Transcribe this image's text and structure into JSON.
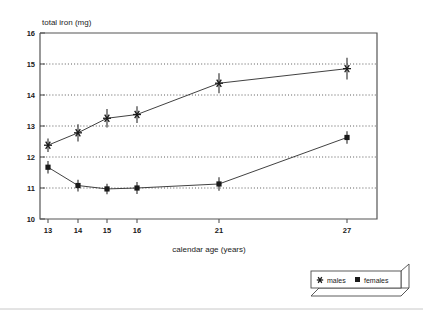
{
  "chart_data": {
    "type": "line",
    "title": "",
    "xlabel": "calendar age (years)",
    "ylabel": "total iron (mg)",
    "x": [
      13,
      14,
      15,
      16,
      21,
      27
    ],
    "xtick_labels": [
      "13",
      "14",
      "15",
      "16",
      "21",
      "27"
    ],
    "ytick_labels": [
      "10",
      "11",
      "12",
      "13",
      "14",
      "15",
      "16"
    ],
    "yticks": [
      10,
      11,
      12,
      13,
      14,
      15,
      16
    ],
    "ylim": [
      10,
      16
    ],
    "grid": "horizontal-dotted",
    "gridlines_at": [
      11,
      12,
      13,
      14,
      15
    ],
    "legend_position": "below-right-outside",
    "series": [
      {
        "name": "males",
        "marker": "asterisk",
        "color": "#1a1a1a",
        "values": [
          12.38,
          12.78,
          13.25,
          13.37,
          14.38,
          14.85
        ],
        "errors": [
          0.22,
          0.28,
          0.3,
          0.27,
          0.32,
          0.35
        ]
      },
      {
        "name": "females",
        "marker": "square",
        "color": "#1a1a1a",
        "values": [
          11.67,
          11.08,
          10.97,
          11.0,
          11.13,
          12.63
        ],
        "errors": [
          0.2,
          0.19,
          0.17,
          0.19,
          0.22,
          0.2
        ]
      }
    ]
  },
  "axes": {
    "y_axis_title": "total iron (mg)",
    "x_axis_title": "calendar age (years)",
    "y_ticks": [
      "16",
      "15",
      "14",
      "13",
      "12",
      "11",
      "10"
    ],
    "x_ticks": [
      "13",
      "14",
      "15",
      "16",
      "21",
      "27"
    ]
  },
  "legend": {
    "entries": [
      {
        "label": "males",
        "marker": "asterisk-marker-icon"
      },
      {
        "label": "females",
        "marker": "square-marker-icon"
      }
    ]
  }
}
